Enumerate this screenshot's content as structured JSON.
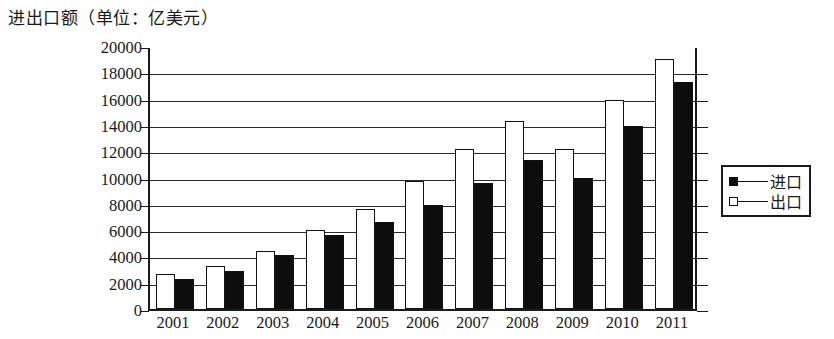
{
  "chart_data": {
    "type": "bar",
    "title": "进出口额（单位：亿美元）",
    "xlabel": "",
    "ylabel": "",
    "ylim": [
      0,
      20000
    ],
    "ytick_step": 2000,
    "grid": true,
    "legend_position": "right",
    "categories": [
      "2001",
      "2002",
      "2003",
      "2004",
      "2005",
      "2006",
      "2007",
      "2008",
      "2009",
      "2010",
      "2011"
    ],
    "ytick_labels": [
      "20000",
      "18000",
      "16000",
      "14000",
      "12000",
      "10000",
      "8000",
      "6000",
      "4000",
      "2000",
      "0"
    ],
    "series": [
      {
        "name": "出口",
        "style": "hollow-square",
        "color": "#ffffff",
        "values": [
          2700,
          3300,
          4400,
          6000,
          7600,
          9700,
          12200,
          14300,
          12200,
          15900,
          19000
        ]
      },
      {
        "name": "进口",
        "style": "filled-square",
        "color": "#0d0d0d",
        "values": [
          2300,
          2900,
          4100,
          5600,
          6600,
          7900,
          9600,
          11300,
          10000,
          13900,
          17300
        ]
      }
    ],
    "legend": [
      {
        "label": "进口",
        "marker": "filled-square"
      },
      {
        "label": "出口",
        "marker": "hollow-square"
      }
    ]
  }
}
